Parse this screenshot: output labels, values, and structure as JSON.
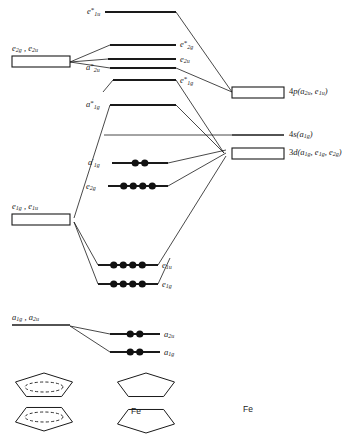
{
  "colors": {
    "line": "#1a1a1a",
    "electron": "#111111",
    "background": "#ffffff"
  },
  "left_fragment": {
    "caption": "ligand group orbitals",
    "groups": [
      {
        "id": "lgo-e2g-e2u",
        "label_parts": [
          "e",
          "2g",
          ", ",
          "e",
          "2u"
        ],
        "label_text": "e2g , e2u",
        "shape": "box",
        "x": 12,
        "y": 56,
        "width": 58,
        "height": 11
      },
      {
        "id": "lgo-e1g-e1u",
        "label_parts": [
          "e",
          "1g",
          ", ",
          "e",
          "1u"
        ],
        "label_text": "e1g , e1u",
        "shape": "box",
        "x": 12,
        "y": 214,
        "width": 58,
        "height": 11
      },
      {
        "id": "lgo-a1g-a2u",
        "label_parts": [
          "a",
          "1g",
          ", ",
          "a",
          "2u"
        ],
        "label_text": "a1g , a2u",
        "shape": "line",
        "x": 12,
        "y": 325,
        "width": 58,
        "height": 0
      }
    ]
  },
  "right_fragment": {
    "caption": "iron atomic orbitals",
    "groups": [
      {
        "id": "ao-4p",
        "label_text": "4p(a2u , e1u)",
        "base": "4p",
        "terms": [
          "a2u",
          "e1u"
        ],
        "shape": "box",
        "x": 232,
        "y": 87,
        "width": 52,
        "height": 11
      },
      {
        "id": "ao-4s",
        "label_text": "4s(a1g)",
        "base": "4s",
        "terms": [
          "a1g"
        ],
        "shape": "line",
        "x": 232,
        "y": 135,
        "width": 52,
        "height": 0
      },
      {
        "id": "ao-3d",
        "label_text": "3d(a1g , e1g , e2g)",
        "base": "3d",
        "terms": [
          "a1g",
          "e1g",
          "e2g"
        ],
        "shape": "box",
        "x": 232,
        "y": 148,
        "width": 52,
        "height": 11
      }
    ]
  },
  "mo_levels": [
    {
      "id": "mo-e1u-star",
      "label_text": "e1u*",
      "sym": "e",
      "sub": "1u",
      "star": true,
      "x": 105,
      "x2": 176,
      "y": 12,
      "electrons": 0,
      "label_x": 87,
      "label_y": 7
    },
    {
      "id": "mo-e2g-star",
      "label_text": "e2g*",
      "sym": "e",
      "sub": "2g",
      "star": true,
      "x": 110,
      "x2": 176,
      "y": 45,
      "electrons": 0,
      "label_x": 180,
      "label_y": 40
    },
    {
      "id": "mo-e2u",
      "label_text": "e2u",
      "sym": "e",
      "sub": "2u",
      "star": false,
      "x": 108,
      "x2": 176,
      "y": 59,
      "electrons": 0,
      "label_x": 180,
      "label_y": 55
    },
    {
      "id": "mo-a2u-star",
      "label_text": "a2u*",
      "sym": "a",
      "sub": "2u",
      "star": true,
      "x": 110,
      "x2": 176,
      "y": 68,
      "electrons": 0,
      "label_x": 86,
      "label_y": 63
    },
    {
      "id": "mo-e1g-star",
      "label_text": "e1g*",
      "sym": "e",
      "sub": "1g",
      "star": true,
      "x": 113,
      "x2": 176,
      "y": 80,
      "electrons": 0,
      "label_x": 180,
      "label_y": 76
    },
    {
      "id": "mo-a1g-star",
      "label_text": "a1g*",
      "sym": "a",
      "sub": "1g",
      "star": true,
      "x": 110,
      "x2": 176,
      "y": 105,
      "electrons": 0,
      "label_x": 86,
      "label_y": 100
    },
    {
      "id": "mo-a1g-prime",
      "label_text": "a1g'",
      "sym": "a",
      "sub": "1g",
      "star": false,
      "prime": true,
      "x": 112,
      "x2": 168,
      "y": 163,
      "electrons": 2,
      "label_x": 88,
      "label_y": 158
    },
    {
      "id": "mo-e2g",
      "label_text": "e2g",
      "sym": "e",
      "sub": "2g",
      "star": false,
      "x": 108,
      "x2": 168,
      "y": 186,
      "electrons": 4,
      "label_x": 86,
      "label_y": 182
    },
    {
      "id": "mo-e1u",
      "label_text": "e1u",
      "sym": "e",
      "sub": "1u",
      "star": false,
      "x": 98,
      "x2": 158,
      "y": 265,
      "electrons": 4,
      "label_x": 162,
      "label_y": 261
    },
    {
      "id": "mo-e1g",
      "label_text": "e1g",
      "sym": "e",
      "sub": "1g",
      "star": false,
      "x": 98,
      "x2": 158,
      "y": 284,
      "electrons": 4,
      "label_x": 162,
      "label_y": 280
    },
    {
      "id": "mo-a2u",
      "label_text": "a2u",
      "sym": "a",
      "sub": "2u",
      "star": false,
      "x": 110,
      "x2": 160,
      "y": 334,
      "electrons": 2,
      "label_x": 164,
      "label_y": 330
    },
    {
      "id": "mo-a1g",
      "label_text": "a1g",
      "sym": "a",
      "sub": "1g",
      "star": false,
      "x": 110,
      "x2": 160,
      "y": 352,
      "electrons": 2,
      "label_x": 164,
      "label_y": 348
    }
  ],
  "correlation_lines": [
    {
      "id": "c1",
      "x1": 70,
      "y1": 62,
      "x2": 110,
      "y2": 45
    },
    {
      "id": "c2",
      "x1": 70,
      "y1": 62,
      "x2": 108,
      "y2": 59
    },
    {
      "id": "c3",
      "x1": 70,
      "y1": 62,
      "x2": 110,
      "y2": 68
    },
    {
      "id": "c4",
      "x1": 176,
      "y1": 12,
      "x2": 232,
      "y2": 92
    },
    {
      "id": "c5",
      "x1": 176,
      "y1": 68,
      "x2": 232,
      "y2": 92
    },
    {
      "id": "c6",
      "x1": 113,
      "y1": 80,
      "x2": 103,
      "y2": 92
    },
    {
      "id": "c7",
      "x1": 176,
      "y1": 80,
      "x2": 224,
      "y2": 153
    },
    {
      "id": "c8",
      "x1": 176,
      "y1": 105,
      "x2": 224,
      "y2": 153
    },
    {
      "id": "c9",
      "x1": 168,
      "y1": 163,
      "x2": 226,
      "y2": 150
    },
    {
      "id": "c10",
      "x1": 168,
      "y1": 186,
      "x2": 226,
      "y2": 153
    },
    {
      "id": "c11",
      "x1": 110,
      "y1": 105,
      "x2": 74,
      "y2": 218
    },
    {
      "id": "c12",
      "x1": 74,
      "y1": 222,
      "x2": 98,
      "y2": 265
    },
    {
      "id": "c13",
      "x1": 74,
      "y1": 222,
      "x2": 98,
      "y2": 284
    },
    {
      "id": "c14",
      "x1": 158,
      "y1": 265,
      "x2": 226,
      "y2": 156
    },
    {
      "id": "c15",
      "x1": 158,
      "y1": 284,
      "x2": 170,
      "y2": 258
    },
    {
      "id": "c16",
      "x1": 70,
      "y1": 326,
      "x2": 110,
      "y2": 334
    },
    {
      "id": "c17",
      "x1": 70,
      "y1": 326,
      "x2": 110,
      "y2": 352
    },
    {
      "id": "c18",
      "x1": 104,
      "y1": 135,
      "x2": 232,
      "y2": 135
    }
  ],
  "structures": [
    {
      "id": "struct-ligands",
      "caption": "",
      "type": "two-rings-with-orbital",
      "x": 14,
      "y": 374
    },
    {
      "id": "struct-ferrocene",
      "caption": "Fe",
      "type": "two-rings-with-metal",
      "x": 116,
      "y": 374,
      "caption_x": 131,
      "caption_y": 406
    },
    {
      "id": "struct-iron",
      "caption": "Fe",
      "type": "metal-only",
      "x": 243,
      "y": 400,
      "caption_x": 243,
      "caption_y": 404
    }
  ]
}
